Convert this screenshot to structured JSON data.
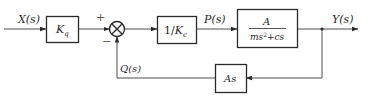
{
  "diagram": {
    "type": "block-diagram",
    "signals": {
      "input": "X(s)",
      "intermediate": "P(s)",
      "output": "Y(s)",
      "feedback": "Q(s)"
    },
    "summing_junction": {
      "plus_sign": "+",
      "minus_sign": "−"
    },
    "blocks": {
      "gain_q": {
        "main": "K",
        "sub": "q"
      },
      "inverse_gain_c": {
        "prefix": "1/",
        "main": "K",
        "sub": "c"
      },
      "plant": {
        "numerator": "A",
        "denominator_main": "ms",
        "denominator_sup": "2",
        "denominator_tail": "+cs"
      },
      "feedback": {
        "label": "As"
      }
    },
    "colors": {
      "line": "#3a3a3a",
      "text": "#2a2a2a",
      "background": "#ffffff"
    }
  }
}
